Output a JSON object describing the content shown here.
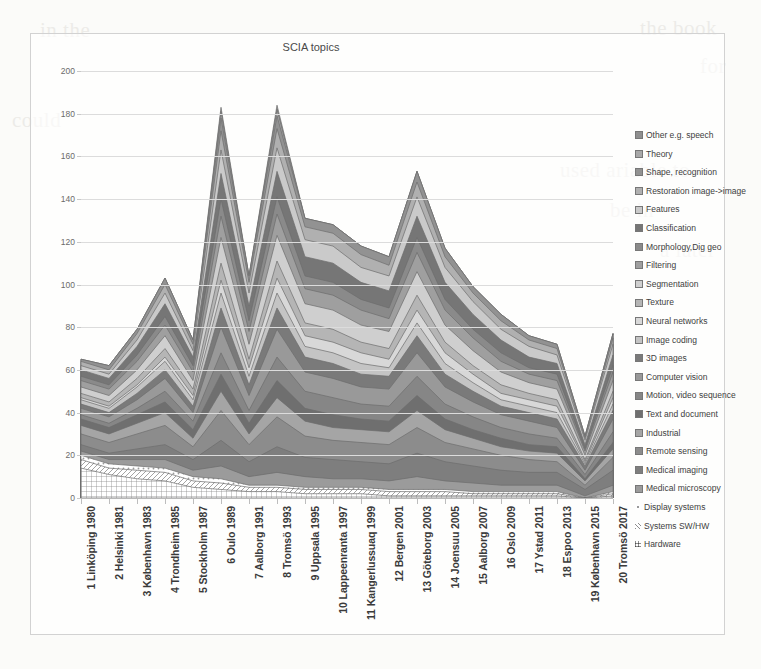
{
  "chart_data": {
    "type": "area",
    "stacked": true,
    "title": "SCIA topics",
    "xlabel": "",
    "ylabel": "",
    "ylim": [
      0,
      200
    ],
    "ytick_step": 20,
    "yticks": [
      0,
      20,
      40,
      60,
      80,
      100,
      120,
      140,
      160,
      180,
      200
    ],
    "grid": true,
    "legend_position": "right",
    "categories": [
      "1 Linköping 1980",
      "2 Helsinki 1981",
      "3 København 1983",
      "4 Trondheim 1985",
      "5 Stockholm 1987",
      "6 Oulo 1989",
      "7 Aalborg 1991",
      "8 Tromsö 1993",
      "9 Uppsala 1995",
      "10 Lappeenranta 1997",
      "11 Kangerlussuaq 1999",
      "12 Bergen 2001",
      "13 Göteborg 2003",
      "14 Joensuu 2005",
      "15 Aalborg 2007",
      "16 Oslo 2009",
      "17 Ystad 2011",
      "18 Espoo 2013",
      "19 København 2015",
      "20 Tromsö 2017"
    ],
    "totals": [
      65,
      62,
      79,
      103,
      74,
      183,
      101,
      184,
      122,
      120,
      114,
      110,
      152,
      113,
      98,
      84,
      80,
      72,
      32,
      78
    ],
    "series": [
      {
        "name": "Hardware",
        "color": "#e8e8e8",
        "pattern": "grid",
        "values": [
          14,
          11,
          9,
          8,
          5,
          4,
          3,
          3,
          2,
          2,
          2,
          1,
          1,
          1,
          1,
          1,
          1,
          1,
          0,
          1
        ]
      },
      {
        "name": "Systems SW/HW",
        "color": "#efefef",
        "pattern": "diagonal",
        "values": [
          4,
          3,
          4,
          4,
          3,
          3,
          2,
          2,
          2,
          2,
          2,
          2,
          2,
          2,
          1,
          1,
          1,
          1,
          0,
          1
        ]
      },
      {
        "name": "Display systems",
        "color": "#f6f6f6",
        "pattern": "dots",
        "values": [
          2,
          2,
          2,
          2,
          2,
          2,
          1,
          1,
          1,
          1,
          1,
          1,
          1,
          1,
          1,
          1,
          1,
          1,
          0,
          1
        ]
      },
      {
        "name": "Medical microscopy",
        "color": "#9b9b9b",
        "pattern": "solid",
        "values": [
          2,
          2,
          3,
          4,
          3,
          6,
          4,
          6,
          5,
          4,
          4,
          4,
          6,
          4,
          4,
          3,
          3,
          3,
          1,
          3
        ]
      },
      {
        "name": "Medical imaging",
        "color": "#7e7e7e",
        "pattern": "solid",
        "values": [
          3,
          3,
          5,
          7,
          5,
          12,
          7,
          12,
          9,
          9,
          8,
          8,
          11,
          9,
          8,
          7,
          6,
          6,
          3,
          7
        ]
      },
      {
        "name": "Remote sensing",
        "color": "#8c8c8c",
        "pattern": "solid",
        "values": [
          5,
          5,
          7,
          9,
          6,
          14,
          8,
          14,
          10,
          9,
          9,
          9,
          12,
          9,
          8,
          7,
          6,
          5,
          2,
          6
        ]
      },
      {
        "name": "Industrial",
        "color": "#a5a5a5",
        "pattern": "solid",
        "values": [
          4,
          4,
          5,
          6,
          4,
          9,
          5,
          9,
          7,
          6,
          6,
          6,
          8,
          6,
          5,
          4,
          4,
          4,
          2,
          4
        ]
      },
      {
        "name": "Text and document",
        "color": "#6f6f6f",
        "pattern": "solid",
        "values": [
          3,
          3,
          4,
          5,
          4,
          8,
          5,
          8,
          6,
          6,
          5,
          5,
          7,
          5,
          4,
          4,
          3,
          3,
          1,
          3
        ]
      },
      {
        "name": "Motion, video sequence",
        "color": "#868686",
        "pattern": "solid",
        "values": [
          2,
          2,
          3,
          5,
          4,
          10,
          6,
          11,
          8,
          8,
          7,
          7,
          9,
          7,
          6,
          5,
          5,
          4,
          2,
          5
        ]
      },
      {
        "name": "Computer vision",
        "color": "#999999",
        "pattern": "solid",
        "values": [
          3,
          3,
          4,
          6,
          4,
          12,
          7,
          13,
          9,
          9,
          8,
          8,
          11,
          8,
          7,
          6,
          6,
          5,
          2,
          6
        ]
      },
      {
        "name": "3D images",
        "color": "#7a7a7a",
        "pattern": "solid",
        "values": [
          2,
          2,
          3,
          4,
          3,
          9,
          5,
          10,
          7,
          7,
          6,
          6,
          8,
          6,
          5,
          4,
          4,
          4,
          2,
          4
        ]
      },
      {
        "name": "Image coding",
        "color": "#c4c4c4",
        "pattern": "solid",
        "values": [
          2,
          2,
          3,
          4,
          3,
          7,
          4,
          7,
          5,
          5,
          5,
          4,
          6,
          5,
          4,
          3,
          3,
          3,
          1,
          3
        ]
      },
      {
        "name": "Neural networks",
        "color": "#d8d8d8",
        "pattern": "solid",
        "values": [
          1,
          1,
          1,
          2,
          2,
          6,
          4,
          7,
          5,
          5,
          5,
          4,
          6,
          5,
          4,
          3,
          3,
          3,
          1,
          3
        ]
      },
      {
        "name": "Texture",
        "color": "#b5b5b5",
        "pattern": "solid",
        "values": [
          2,
          2,
          3,
          4,
          3,
          8,
          4,
          8,
          6,
          6,
          5,
          5,
          7,
          5,
          4,
          4,
          3,
          3,
          1,
          3
        ]
      },
      {
        "name": "Segmentation",
        "color": "#cfcfcf",
        "pattern": "solid",
        "values": [
          3,
          3,
          4,
          6,
          4,
          12,
          7,
          12,
          9,
          9,
          8,
          8,
          11,
          8,
          7,
          6,
          5,
          5,
          2,
          5
        ]
      },
      {
        "name": "Filtering",
        "color": "#9f9f9f",
        "pattern": "solid",
        "values": [
          3,
          3,
          4,
          5,
          4,
          10,
          6,
          10,
          7,
          7,
          7,
          6,
          9,
          7,
          6,
          5,
          4,
          4,
          2,
          4
        ]
      },
      {
        "name": "Morphology,Dig geo",
        "color": "#8a8a8a",
        "pattern": "solid",
        "values": [
          2,
          2,
          3,
          4,
          3,
          8,
          5,
          8,
          6,
          6,
          5,
          5,
          7,
          5,
          4,
          4,
          3,
          3,
          1,
          3
        ]
      },
      {
        "name": "Classification",
        "color": "#767676",
        "pattern": "solid",
        "values": [
          3,
          3,
          4,
          6,
          4,
          12,
          7,
          12,
          9,
          9,
          8,
          8,
          10,
          8,
          7,
          6,
          5,
          5,
          2,
          5
        ]
      },
      {
        "name": "Features",
        "color": "#cacaca",
        "pattern": "solid",
        "values": [
          2,
          2,
          3,
          5,
          3,
          11,
          6,
          11,
          8,
          8,
          7,
          7,
          9,
          7,
          6,
          5,
          5,
          4,
          2,
          5
        ]
      },
      {
        "name": "Restoration image->image",
        "color": "#b0b0b0",
        "pattern": "solid",
        "values": [
          2,
          2,
          3,
          4,
          3,
          9,
          5,
          9,
          6,
          6,
          6,
          5,
          7,
          5,
          4,
          4,
          3,
          3,
          1,
          3
        ]
      },
      {
        "name": "Shape, recognition",
        "color": "#929292",
        "pattern": "solid",
        "values": [
          1,
          2,
          2,
          3,
          2,
          6,
          3,
          6,
          4,
          4,
          4,
          4,
          5,
          4,
          3,
          3,
          2,
          2,
          1,
          2
        ]
      },
      {
        "name": "Theory",
        "color": "#a8a8a8",
        "pattern": "solid",
        "values": [
          0,
          0,
          0,
          0,
          0,
          3,
          0,
          3,
          0,
          0,
          0,
          0,
          0,
          0,
          0,
          0,
          0,
          0,
          0,
          0
        ]
      },
      {
        "name": "Other e.g. speech",
        "color": "#8f8f8f",
        "pattern": "solid",
        "values": [
          0,
          0,
          0,
          0,
          0,
          2,
          0,
          2,
          0,
          0,
          0,
          0,
          0,
          0,
          0,
          0,
          0,
          0,
          0,
          0
        ]
      }
    ],
    "legend_entries": [
      {
        "label": "Other e.g. speech",
        "marker": "solid",
        "color": "#8f8f8f"
      },
      {
        "label": "Theory",
        "marker": "solid",
        "color": "#a8a8a8"
      },
      {
        "label": "Shape, recognition",
        "marker": "solid",
        "color": "#929292"
      },
      {
        "label": "Restoration image->image",
        "marker": "solid",
        "color": "#b0b0b0"
      },
      {
        "label": "Features",
        "marker": "solid",
        "color": "#cacaca"
      },
      {
        "label": "Classification",
        "marker": "solid",
        "color": "#767676"
      },
      {
        "label": "Morphology,Dig geo",
        "marker": "solid",
        "color": "#8a8a8a"
      },
      {
        "label": "Filtering",
        "marker": "solid",
        "color": "#9f9f9f"
      },
      {
        "label": "Segmentation",
        "marker": "solid",
        "color": "#cfcfcf"
      },
      {
        "label": "Texture",
        "marker": "solid",
        "color": "#b5b5b5"
      },
      {
        "label": "Neural networks",
        "marker": "solid",
        "color": "#d8d8d8"
      },
      {
        "label": "Image coding",
        "marker": "solid",
        "color": "#c4c4c4"
      },
      {
        "label": "3D images",
        "marker": "solid",
        "color": "#7a7a7a"
      },
      {
        "label": "Computer vision",
        "marker": "solid",
        "color": "#999999"
      },
      {
        "label": "Motion, video sequence",
        "marker": "solid",
        "color": "#868686"
      },
      {
        "label": "Text and document",
        "marker": "solid",
        "color": "#6f6f6f"
      },
      {
        "label": "Industrial",
        "marker": "solid",
        "color": "#a5a5a5"
      },
      {
        "label": "Remote sensing",
        "marker": "solid",
        "color": "#8c8c8c"
      },
      {
        "label": "Medical imaging",
        "marker": "solid",
        "color": "#7e7e7e"
      },
      {
        "label": "Medical microscopy",
        "marker": "solid",
        "color": "#9b9b9b"
      },
      {
        "label": "Display systems",
        "marker": "dots",
        "color": "#f6f6f6"
      },
      {
        "label": "Systems SW/HW",
        "marker": "diagonal",
        "color": "#efefef"
      },
      {
        "label": "Hardware",
        "marker": "grid",
        "color": "#e8e8e8"
      }
    ]
  },
  "background_bleed": [
    {
      "text": "the book",
      "x": 640,
      "y": 8
    },
    {
      "text": "for",
      "x": 700,
      "y": 46
    },
    {
      "text": "used ariable to",
      "x": 560,
      "y": 150
    },
    {
      "text": "be in",
      "x": 610,
      "y": 190
    },
    {
      "text": "a later",
      "x": 660,
      "y": 230
    },
    {
      "text": "in the",
      "x": 40,
      "y": 10
    },
    {
      "text": "could",
      "x": 12,
      "y": 100
    }
  ]
}
